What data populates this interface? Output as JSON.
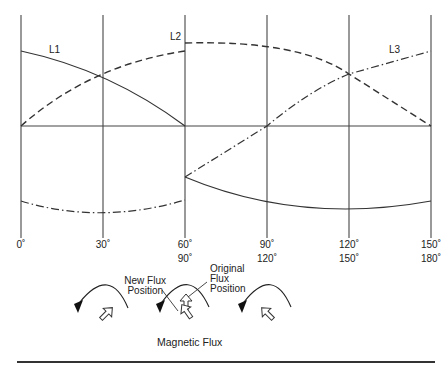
{
  "diagram": {
    "title": "Magnetic Flux",
    "phase_labels": [
      "L1",
      "L2",
      "L3"
    ],
    "x_ticks_row1": [
      "0˚",
      "30˚",
      "60˚",
      "90˚",
      "120˚",
      "150˚"
    ],
    "x_ticks_row2": [
      "90˚",
      "120˚",
      "150˚",
      "180˚"
    ],
    "annotations": {
      "new_flux_line1": "New Flux",
      "new_flux_line2": "Position",
      "orig_flux_line1": "Original",
      "orig_flux_line2": "Flux",
      "orig_flux_line3": "Position"
    },
    "line_styles": {
      "L1": "solid",
      "L2": "dashed",
      "L3": "dash-dot"
    },
    "colors": {
      "line": "#333333",
      "grid": "#555555",
      "background": "#ffffff"
    }
  }
}
